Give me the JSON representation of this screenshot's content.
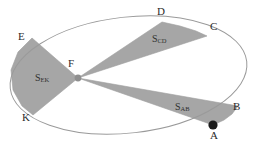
{
  "figure": {
    "kind": "geometry-diagram",
    "background_color": "#ffffff",
    "canvas": {
      "width": 258,
      "height": 151
    }
  },
  "style": {
    "ellipse_stroke": "#9a9a9a",
    "ellipse_stroke_width": 1.0,
    "sector_fill": "#a6a6a6",
    "sector_stroke": "#9d9d9d",
    "focus_dot_fill": "#8f8f8f",
    "orbit_dot_fill": "#1c1c1c",
    "label_color": "#2b2b2b",
    "area_label_color": "#30302f"
  },
  "ellipse": {
    "name": "orbit",
    "center_x": 128.5,
    "center_y": 75,
    "radius_x": 119,
    "radius_y": 58,
    "rotation_deg": -6.5
  },
  "focus": {
    "label": "F",
    "x": 78,
    "y": 78,
    "dot_radius": 3.4,
    "label_x": 68,
    "label_y": 58
  },
  "orbit_marker": {
    "label": "A",
    "x": 213,
    "y": 125,
    "dot_radius": 4.6
  },
  "vertices": [
    {
      "label": "D",
      "x": 162,
      "y": 22,
      "label_x": 157,
      "label_y": 6
    },
    {
      "label": "C",
      "x": 207,
      "y": 36,
      "label_x": 210,
      "label_y": 21
    },
    {
      "label": "B",
      "x": 238,
      "y": 106,
      "label_x": 233,
      "label_y": 101
    },
    {
      "label": "A",
      "x": 213,
      "y": 125,
      "label_x": 210,
      "label_y": 130
    },
    {
      "label": "K",
      "x": 33,
      "y": 115,
      "label_x": 22,
      "label_y": 112
    },
    {
      "label": "E",
      "x": 32,
      "y": 38,
      "label_x": 18,
      "label_y": 31
    }
  ],
  "sectors": [
    {
      "name": "sector-ek",
      "label_base": "S",
      "label_sub": "EK",
      "from": "E",
      "to": "K",
      "label_x": 35,
      "label_y": 73,
      "arc_points": "32,38 18,52 11,70 13,90 22,106 33,115"
    },
    {
      "name": "sector-cd",
      "label_base": "S",
      "label_sub": "CD",
      "from": "D",
      "to": "C",
      "label_x": 152,
      "label_y": 34,
      "arc_points": "162,22 180,26 196,31 207,36"
    },
    {
      "name": "sector-ab",
      "label_base": "S",
      "label_sub": "AB",
      "from": "A",
      "to": "B",
      "label_x": 175,
      "label_y": 102,
      "arc_points": "213,125 224,120 232,114 238,106"
    }
  ]
}
